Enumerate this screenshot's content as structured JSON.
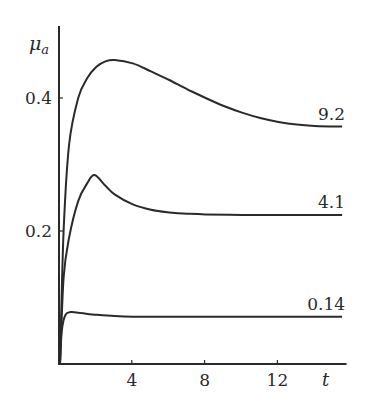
{
  "chart_data": {
    "type": "line",
    "title": "",
    "xlabel": "t",
    "ylabel": "μ_a",
    "xlim": [
      0,
      15.8
    ],
    "ylim": [
      0,
      0.5
    ],
    "x_ticks": [
      4,
      8,
      12
    ],
    "y_ticks": [
      0.2,
      0.4
    ],
    "x_tick_labels": [
      "4",
      "8",
      "12"
    ],
    "y_tick_labels": [
      "0.2",
      "0.4"
    ],
    "grid": false,
    "legend": "inline labels at right end of curves",
    "series": [
      {
        "name": "9.2",
        "x": [
          0,
          0.2,
          0.5,
          1.0,
          1.5,
          2.0,
          2.5,
          3.0,
          4.0,
          5.0,
          6.0,
          7.0,
          8.0,
          9.0,
          10.0,
          11.0,
          12.0,
          13.0,
          14.0,
          15.5
        ],
        "values": [
          0.0,
          0.2,
          0.33,
          0.4,
          0.43,
          0.447,
          0.455,
          0.457,
          0.452,
          0.44,
          0.427,
          0.413,
          0.4,
          0.388,
          0.378,
          0.37,
          0.364,
          0.36,
          0.358,
          0.357
        ]
      },
      {
        "name": "4.1",
        "x": [
          0,
          0.2,
          0.5,
          1.0,
          1.5,
          1.9,
          2.5,
          3.0,
          4.0,
          5.0,
          6.0,
          7.0,
          8.0,
          10.0,
          12.0,
          15.5
        ],
        "values": [
          0.0,
          0.13,
          0.19,
          0.245,
          0.272,
          0.284,
          0.268,
          0.255,
          0.24,
          0.232,
          0.228,
          0.226,
          0.225,
          0.224,
          0.224,
          0.224
        ]
      },
      {
        "name": "0.14",
        "x": [
          0,
          0.1,
          0.3,
          0.6,
          1.0,
          2.0,
          3.0,
          4.0,
          6.0,
          8.0,
          12.0,
          15.5
        ],
        "values": [
          0.0,
          0.05,
          0.074,
          0.078,
          0.077,
          0.074,
          0.072,
          0.071,
          0.071,
          0.071,
          0.071,
          0.071
        ]
      }
    ]
  }
}
